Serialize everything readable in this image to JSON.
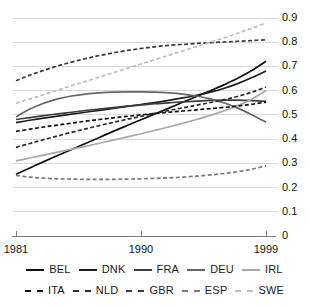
{
  "chart_data": {
    "type": "line",
    "title": "",
    "subtitle": "",
    "xlabel": "",
    "ylabel": "",
    "xlim": [
      1981,
      1999
    ],
    "ylim": [
      0,
      0.9
    ],
    "grid": true,
    "legend_position": "bottom",
    "x_ticks": [
      "1981",
      "1990",
      "1999"
    ],
    "x_tick_values": [
      1981,
      1990,
      1999
    ],
    "y_ticks": [
      "0",
      "0.1",
      "0.2",
      "0.3",
      "0.4",
      "0.5",
      "0.6",
      "0.7",
      "0.8",
      "0.9"
    ],
    "y_tick_values": [
      0,
      0.1,
      0.2,
      0.3,
      0.4,
      0.5,
      0.6,
      0.7,
      0.8,
      0.9
    ],
    "y_axis_side": "right",
    "x": [
      1981,
      1982,
      1983,
      1984,
      1985,
      1986,
      1987,
      1988,
      1989,
      1990,
      1991,
      1992,
      1993,
      1994,
      1995,
      1996,
      1997,
      1998,
      1999
    ],
    "series": [
      {
        "name": "BEL",
        "style": "solid",
        "color": "#111111",
        "values": [
          0.255,
          0.281,
          0.307,
          0.332,
          0.357,
          0.382,
          0.407,
          0.432,
          0.456,
          0.48,
          0.504,
          0.528,
          0.552,
          0.576,
          0.6,
          0.625,
          0.652,
          0.684,
          0.722
        ]
      },
      {
        "name": "DNK",
        "style": "solid",
        "color": "#1f1f1f",
        "values": [
          0.468,
          0.478,
          0.487,
          0.495,
          0.503,
          0.511,
          0.519,
          0.527,
          0.535,
          0.543,
          0.551,
          0.56,
          0.57,
          0.581,
          0.594,
          0.61,
          0.63,
          0.654,
          0.681
        ]
      },
      {
        "name": "FRA",
        "style": "solid",
        "color": "#3d3d3d",
        "values": [
          0.481,
          0.489,
          0.497,
          0.504,
          0.511,
          0.518,
          0.524,
          0.53,
          0.536,
          0.541,
          0.546,
          0.55,
          0.554,
          0.557,
          0.56,
          0.561,
          0.561,
          0.559,
          0.556
        ]
      },
      {
        "name": "DEU",
        "style": "solid",
        "color": "#666666",
        "values": [
          0.492,
          0.524,
          0.548,
          0.566,
          0.578,
          0.586,
          0.591,
          0.594,
          0.595,
          0.595,
          0.594,
          0.591,
          0.586,
          0.578,
          0.566,
          0.549,
          0.527,
          0.5,
          0.47
        ]
      },
      {
        "name": "IRL",
        "style": "solid",
        "color": "#a8a8a8",
        "values": [
          0.31,
          0.322,
          0.334,
          0.346,
          0.358,
          0.37,
          0.383,
          0.396,
          0.409,
          0.422,
          0.436,
          0.45,
          0.465,
          0.481,
          0.498,
          0.517,
          0.539,
          0.566,
          0.6
        ]
      },
      {
        "name": "ITA",
        "style": "dashed",
        "color": "#111111",
        "values": [
          0.432,
          0.441,
          0.45,
          0.458,
          0.466,
          0.474,
          0.481,
          0.488,
          0.494,
          0.5,
          0.506,
          0.511,
          0.516,
          0.521,
          0.526,
          0.531,
          0.537,
          0.544,
          0.553
        ]
      },
      {
        "name": "NLD",
        "style": "dashed",
        "color": "#2b2b2b",
        "values": [
          0.366,
          0.382,
          0.398,
          0.413,
          0.428,
          0.442,
          0.456,
          0.469,
          0.482,
          0.494,
          0.506,
          0.518,
          0.529,
          0.54,
          0.551,
          0.563,
          0.577,
          0.594,
          0.615
        ]
      },
      {
        "name": "GBR",
        "style": "dashed",
        "color": "#3a3a3a",
        "values": [
          0.641,
          0.664,
          0.684,
          0.702,
          0.718,
          0.732,
          0.745,
          0.756,
          0.766,
          0.774,
          0.781,
          0.787,
          0.791,
          0.795,
          0.798,
          0.801,
          0.804,
          0.807,
          0.81
        ]
      },
      {
        "name": "ESP",
        "style": "dashed",
        "color": "#7a7a7a",
        "values": [
          0.25,
          0.243,
          0.239,
          0.236,
          0.235,
          0.234,
          0.234,
          0.234,
          0.235,
          0.236,
          0.238,
          0.24,
          0.243,
          0.247,
          0.252,
          0.258,
          0.266,
          0.276,
          0.29
        ]
      },
      {
        "name": "SWE",
        "style": "dashed",
        "color": "#bdbdbd",
        "values": [
          0.548,
          0.566,
          0.584,
          0.602,
          0.62,
          0.638,
          0.656,
          0.674,
          0.692,
          0.71,
          0.728,
          0.746,
          0.764,
          0.782,
          0.8,
          0.818,
          0.838,
          0.858,
          0.88
        ]
      }
    ]
  },
  "legend": {
    "row1": [
      {
        "label": "BEL",
        "style": "solid",
        "color": "#111111"
      },
      {
        "label": "DNK",
        "style": "solid",
        "color": "#1f1f1f"
      },
      {
        "label": "FRA",
        "style": "solid",
        "color": "#3d3d3d"
      },
      {
        "label": "DEU",
        "style": "solid",
        "color": "#666666"
      },
      {
        "label": "IRL",
        "style": "solid",
        "color": "#a8a8a8"
      }
    ],
    "row2": [
      {
        "label": "ITA",
        "style": "dashed",
        "color": "#111111"
      },
      {
        "label": "NLD",
        "style": "dashed",
        "color": "#2b2b2b"
      },
      {
        "label": "GBR",
        "style": "dashed",
        "color": "#3a3a3a"
      },
      {
        "label": "ESP",
        "style": "dashed",
        "color": "#7a7a7a"
      },
      {
        "label": "SWE",
        "style": "dashed",
        "color": "#bdbdbd"
      }
    ]
  },
  "style": {
    "grid_color": "#d9d9d9",
    "axis_color": "#7a7a7a",
    "text_color": "#111111",
    "background": "#ffffff"
  }
}
